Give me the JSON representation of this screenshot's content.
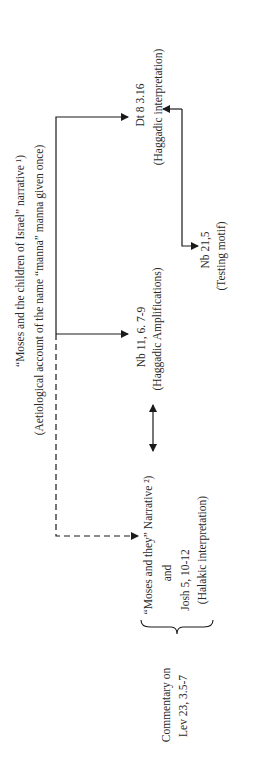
{
  "diagram": {
    "source": {
      "line1": "“Moses and the children of Israel” narrative ¹)",
      "line2": "(Aetiological account of the name “manna” manna given once)"
    },
    "nodes": {
      "dt": {
        "ref": "Dt 8 3.16",
        "note": "(Haggadic interpretation)"
      },
      "nb11": {
        "ref": "Nb 11, 6. 7-9",
        "note": "(Haggadic Amplifications)"
      },
      "nb21": {
        "ref": "Nb 21,5",
        "note": "(Testing motif)"
      },
      "group": {
        "line1": "“Moses and they” Narrative ²)",
        "line2": "and",
        "line3": "Josh 5, 10-12",
        "line4": "(Halakic interpretation)"
      },
      "commentary": {
        "line1": "Commentary on",
        "line2": "Lev 23, 3.5-7"
      }
    },
    "colors": {
      "line": "#1a1a1a",
      "text": "#2a2a2a"
    }
  }
}
